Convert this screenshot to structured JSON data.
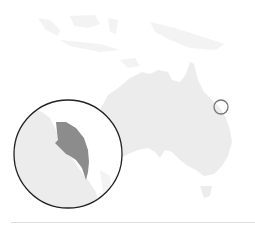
{
  "map": {
    "subject": "Australia locator map",
    "colors": {
      "background": "#ffffff",
      "land": "#ececec",
      "land_faint": "#f3f3f3",
      "highlight": "#8c8c8c",
      "marker_stroke": "#777777",
      "inset_stroke": "#222222",
      "divider": "#dcdcdc"
    },
    "locator_marker": {
      "cx": 221,
      "cy": 107,
      "r": 7
    },
    "inset": {
      "cx": 68,
      "cy": 154,
      "r": 54,
      "content": "magnified highlighted region"
    }
  }
}
